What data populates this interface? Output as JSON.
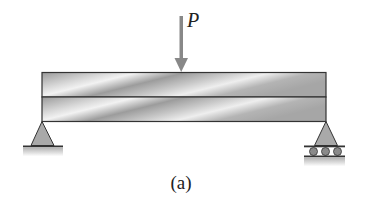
{
  "figure": {
    "caption": "(a)",
    "load": {
      "label": "P",
      "direction": "down",
      "position": "midspan"
    },
    "beam": {
      "layers": 2,
      "description": "two-layer composite beam"
    },
    "supports": [
      {
        "side": "left",
        "type": "pin"
      },
      {
        "side": "right",
        "type": "roller"
      }
    ]
  },
  "colors": {
    "outline": "#333333",
    "arrow": "#888888",
    "support_fill": "#a9a9a9",
    "roller_fill": "#8a8a8a",
    "beam_light": "#eeeeee",
    "beam_dark": "#8f8f8f"
  }
}
